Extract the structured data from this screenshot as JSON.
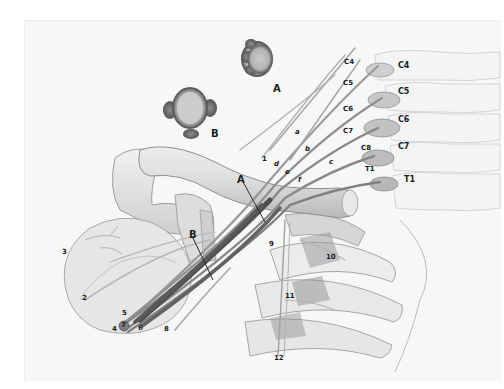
{
  "figure": {
    "background_color": "#ffffff",
    "panel_color": "#f7f7f7",
    "nerve_color": "#8a8a8a",
    "nerve_dark_color": "#4a4a4a",
    "bone_color": "#e2e2e2",
    "insets": [
      {
        "id": "A",
        "label": "A"
      },
      {
        "id": "B",
        "label": "B"
      }
    ],
    "vertebrae_labels": [
      "C4",
      "C5",
      "C6",
      "C7",
      "T1"
    ],
    "root_labels": [
      "C4",
      "C5",
      "C6",
      "C7",
      "C8",
      "T1"
    ],
    "trunk_labels": [
      "a",
      "b",
      "c"
    ],
    "division_labels": [
      "d",
      "e",
      "f"
    ],
    "section_markers": {
      "A": "A",
      "B": "B"
    },
    "numbered_labels": [
      "1",
      "2",
      "3",
      "4",
      "5",
      "6",
      "7",
      "8",
      "9",
      "10",
      "11",
      "12"
    ]
  }
}
